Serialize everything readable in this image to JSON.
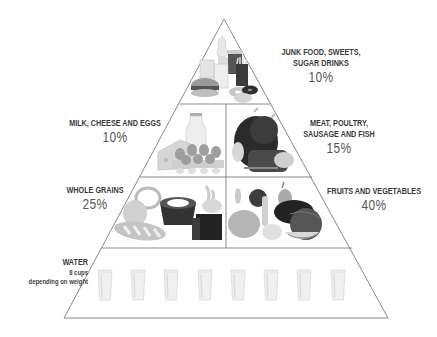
{
  "tiers": [
    {
      "id": "junk",
      "label_line1": "JUNK FOOD, SWEETS,",
      "label_line2": "SUGAR DRINKS",
      "percent": "10%"
    },
    {
      "id": "milk",
      "label_line1": "MILK, CHEESE AND EGGS",
      "percent": "10%"
    },
    {
      "id": "meat",
      "label_line1": "MEAT, POULTRY,",
      "label_line2": "SAUSAGE AND FISH",
      "percent": "15%"
    },
    {
      "id": "grains",
      "label_line1": "WHOLE GRAINS",
      "percent": "25%"
    },
    {
      "id": "fruits",
      "label_line1": "FRUITS AND VEGETABLES",
      "percent": "40%"
    },
    {
      "id": "water",
      "label_line1": "WATER",
      "sub1": "8 cups",
      "sub2": "depending on weight",
      "glass_count": 8
    }
  ],
  "colors": {
    "outline": "#7a7a7a",
    "text": "#3a3a3a",
    "percent": "#555555"
  }
}
